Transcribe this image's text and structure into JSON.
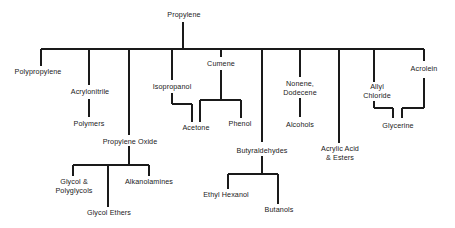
{
  "diagram": {
    "root": "Propylene",
    "nodes": {
      "propylene": "Propylene",
      "polypropylene": "Polypropylene",
      "acrylonitrile": "Acrylonitrile",
      "polymers": "Polymers",
      "propylene_oxide": "Propylene Oxide",
      "glycol_polyglycols_1": "Glycol &",
      "glycol_polyglycols_2": "Polyglycols",
      "alkanolamines": "Alkanolamines",
      "glycol_ethers": "Glycol Ethers",
      "isopropanol": "Isopropanol",
      "cumene": "Cumene",
      "acetone": "Acetone",
      "phenol": "Phenol",
      "butyraldehydes": "Butyraldehydes",
      "ethyl_hexanol": "Ethyl Hexanol",
      "butanols": "Butanols",
      "nonene_1": "Nonene,",
      "nonene_2": "Dodecene",
      "alcohols": "Alcohols",
      "acrylic_1": "Acrylic Acid",
      "acrylic_2": "& Esters",
      "allyl_1": "Allyl",
      "allyl_2": "Chloride",
      "glycerine": "Glycerine",
      "acrolein": "Acrolein"
    },
    "edges": [
      [
        "Propylene",
        "Polypropylene"
      ],
      [
        "Propylene",
        "Acrylonitrile"
      ],
      [
        "Acrylonitrile",
        "Polymers"
      ],
      [
        "Propylene",
        "Propylene Oxide"
      ],
      [
        "Propylene Oxide",
        "Glycol & Polyglycols"
      ],
      [
        "Propylene Oxide",
        "Glycol Ethers"
      ],
      [
        "Propylene Oxide",
        "Alkanolamines"
      ],
      [
        "Propylene",
        "Isopropanol"
      ],
      [
        "Isopropanol",
        "Acetone"
      ],
      [
        "Propylene",
        "Cumene"
      ],
      [
        "Cumene",
        "Acetone"
      ],
      [
        "Cumene",
        "Phenol"
      ],
      [
        "Propylene",
        "Butyraldehydes"
      ],
      [
        "Butyraldehydes",
        "Ethyl Hexanol"
      ],
      [
        "Butyraldehydes",
        "Butanols"
      ],
      [
        "Propylene",
        "Nonene, Dodecene"
      ],
      [
        "Nonene, Dodecene",
        "Alcohols"
      ],
      [
        "Propylene",
        "Acrylic Acid & Esters"
      ],
      [
        "Propylene",
        "Allyl Chloride"
      ],
      [
        "Allyl Chloride",
        "Glycerine"
      ],
      [
        "Propylene",
        "Acrolein"
      ],
      [
        "Acrolein",
        "Glycerine"
      ]
    ]
  }
}
